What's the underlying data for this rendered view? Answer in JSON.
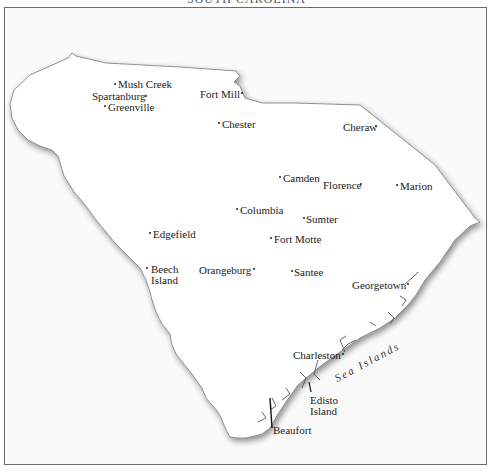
{
  "header": {
    "title_cut": "SOUTH CAROLINA"
  },
  "map": {
    "region": "South Carolina",
    "colors": {
      "land": "#ffffff",
      "outline": "#777777",
      "shadow": "#bbbbbb",
      "frame": "#6a6a6a",
      "text": "#222222"
    },
    "places": [
      {
        "name": "Mush Creek",
        "x": 114,
        "y": 79
      },
      {
        "name": "Spartanburg",
        "x": 92,
        "y": 90
      },
      {
        "name": "Greenville",
        "x": 106,
        "y": 101
      },
      {
        "name": "Fort Mill",
        "x": 200,
        "y": 88
      },
      {
        "name": "Chester",
        "x": 218,
        "y": 118
      },
      {
        "name": "Cheraw",
        "x": 343,
        "y": 121
      },
      {
        "name": "Camden",
        "x": 280,
        "y": 172
      },
      {
        "name": "Florence",
        "x": 323,
        "y": 179
      },
      {
        "name": "Marion",
        "x": 396,
        "y": 180
      },
      {
        "name": "Columbia",
        "x": 235,
        "y": 204
      },
      {
        "name": "Sumter",
        "x": 303,
        "y": 213
      },
      {
        "name": "Edgefield",
        "x": 148,
        "y": 228
      },
      {
        "name": "Fort Motte",
        "x": 270,
        "y": 233
      },
      {
        "name": "Beech",
        "x": 150,
        "y": 264
      },
      {
        "name": "Island",
        "x": 150,
        "y": 275
      },
      {
        "name": "Orangeburg",
        "x": 199,
        "y": 264
      },
      {
        "name": "Santee",
        "x": 290,
        "y": 266
      },
      {
        "name": "Georgetown",
        "x": 352,
        "y": 279
      },
      {
        "name": "Charleston",
        "x": 293,
        "y": 348
      },
      {
        "name": "Edisto",
        "x": 310,
        "y": 393
      },
      {
        "name": "Island2",
        "x": 310,
        "y": 404
      },
      {
        "name": "Beaufort",
        "x": 272,
        "y": 424
      }
    ],
    "labels": {
      "mush_creek": "Mush Creek",
      "spartanburg": "Spartanburg",
      "greenville": "Greenville",
      "fort_mill": "Fort Mill",
      "chester": "Chester",
      "cheraw": "Cheraw",
      "camden": "Camden",
      "florence": "Florence",
      "marion": "Marion",
      "columbia": "Columbia",
      "sumter": "Sumter",
      "edgefield": "Edgefield",
      "fort_motte": "Fort Motte",
      "beech": "Beech",
      "beech_island": "Island",
      "orangeburg": "Orangeburg",
      "santee": "Santee",
      "georgetown": "Georgetown",
      "charleston": "Charleston",
      "edisto": "Edisto",
      "edisto_island": "Island",
      "beaufort": "Beaufort",
      "sea_islands": "Sea Islands"
    }
  }
}
